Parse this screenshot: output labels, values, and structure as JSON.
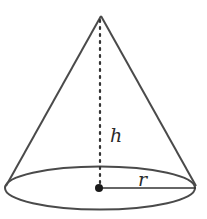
{
  "diagram": {
    "type": "cone",
    "labels": {
      "height": "h",
      "radius": "r"
    },
    "colors": {
      "stroke": "#4a4a4a",
      "background": "#ffffff",
      "text": "#2a2a2a"
    }
  }
}
